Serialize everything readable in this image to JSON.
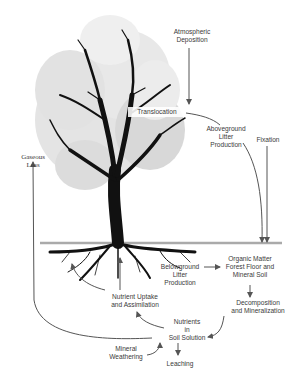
{
  "diagram": {
    "labels": {
      "atmospheric_deposition": "Atmospheric\nDeposition",
      "translocation": "Translocation",
      "aboveground_litter": "Aboveground\nLitter\nProduction",
      "fixation": "Fixation",
      "gaseous_loss": "Gaseous\nLoss",
      "organic_matter": "Organic Matter\nForest Floor and\nMineral Soil",
      "belowground_litter": "Belowground\nLitter\nProduction",
      "nutrient_uptake": "Nutrient Uptake\nand Assimilation",
      "decomposition": "Decomposition\nand Mineralization",
      "nutrients_soil": "Nutrients\nin\nSoil Solution",
      "mineral_weathering": "Mineral\nWeathering",
      "leaching": "Leaching"
    },
    "colors": {
      "arrow": "#555555",
      "ground_line": "#aaaaaa",
      "canopy": "#d9d9d9",
      "trunk": "#111111",
      "text": "#3a3a3a"
    }
  }
}
